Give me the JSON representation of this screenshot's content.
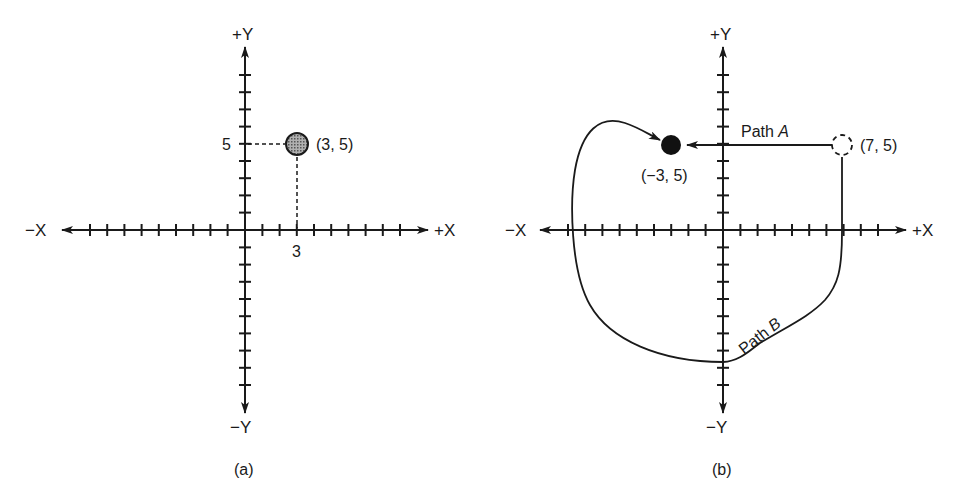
{
  "figure": {
    "panels": [
      {
        "id": "a",
        "caption": "(a)",
        "axes": {
          "pos_x": "+X",
          "neg_x": "−X",
          "pos_y": "+Y",
          "neg_y": "−Y",
          "x_ticks_each_side": 9,
          "y_ticks_each_side": 7
        },
        "point": {
          "label": "(3, 5)",
          "x": 3,
          "y": 5,
          "style": "shaded",
          "color": "#8a8a8a"
        },
        "x_tick_label": "3",
        "y_tick_label": "5"
      },
      {
        "id": "b",
        "caption": "(b)",
        "axes": {
          "pos_x": "+X",
          "neg_x": "−X",
          "pos_y": "+Y",
          "neg_y": "−Y",
          "x_ticks_each_side": 9,
          "y_ticks_each_side": 7
        },
        "start_point": {
          "label": "(7, 5)",
          "x": 7,
          "y": 5,
          "style": "dashed-outline"
        },
        "end_point": {
          "label": "(−3, 5)",
          "x": -3,
          "y": 5,
          "style": "filled",
          "color": "#111111"
        },
        "paths": [
          {
            "name": "Path A",
            "prefix": "Path ",
            "letter": "A",
            "type": "straight"
          },
          {
            "name": "Path B",
            "prefix": "Path ",
            "letter": "B",
            "type": "curved"
          }
        ]
      }
    ]
  }
}
